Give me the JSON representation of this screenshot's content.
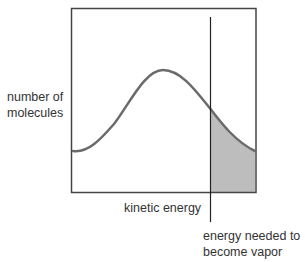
{
  "diagram": {
    "y_axis_label_line1": "number of",
    "y_axis_label_line2": "molecules",
    "x_axis_label": "kinetic energy",
    "threshold_label_line1": "energy needed to",
    "threshold_label_line2": "become vapor",
    "colors": {
      "frame": "#444444",
      "curve": "#6b6b6b",
      "threshold_line": "#222222",
      "shaded_area": "#bdbdbd",
      "text": "#333333"
    }
  }
}
